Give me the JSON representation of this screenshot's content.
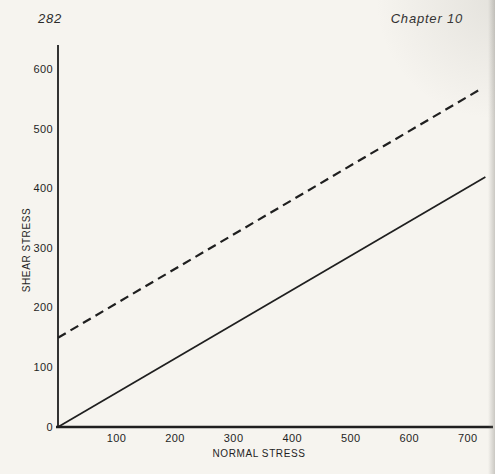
{
  "header": {
    "page_number": "282",
    "chapter": "Chapter 10"
  },
  "colors": {
    "background": "#f6f4ef",
    "ink": "#1f1f1f",
    "edge_shade": "#d9d7d2"
  },
  "chart_data": {
    "type": "line",
    "title": "",
    "xlabel": "NORMAL STRESS",
    "ylabel": "SHEAR STRESS",
    "xlim": [
      0,
      743
    ],
    "ylim": [
      0,
      642
    ],
    "xticks": [
      100,
      200,
      300,
      400,
      500,
      600,
      700
    ],
    "yticks": [
      0,
      100,
      200,
      300,
      400,
      500,
      600
    ],
    "grid": false,
    "legend": "none",
    "series": [
      {
        "name": "solid-envelope",
        "style": "solid",
        "points": [
          [
            0,
            0
          ],
          [
            730,
            420
          ]
        ]
      },
      {
        "name": "dashed-envelope",
        "style": "dashed",
        "points": [
          [
            0,
            150
          ],
          [
            722,
            568
          ]
        ]
      }
    ]
  }
}
